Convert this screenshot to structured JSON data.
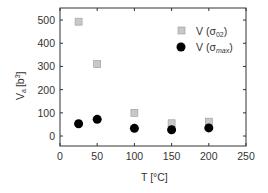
{
  "chart_data": {
    "type": "scatter",
    "title": "",
    "xlabel": "T [°C]",
    "ylabel": "Va [b3]",
    "xlim": [
      0,
      250
    ],
    "ylim": [
      -43,
      552
    ],
    "xticks": [
      0,
      50,
      100,
      150,
      200,
      250
    ],
    "yticks": [
      0,
      100,
      200,
      300,
      400,
      500
    ],
    "grid": false,
    "legend_position": "upper right",
    "series": [
      {
        "name": "V (σ02)",
        "marker": "square",
        "color": "#c8c8c8",
        "x": [
          25,
          50,
          100,
          150,
          200
        ],
        "y": [
          493,
          310,
          100,
          55,
          62
        ]
      },
      {
        "name": "V (σmax)",
        "marker": "circle",
        "color": "#000000",
        "x": [
          25,
          50,
          100,
          150,
          200
        ],
        "y": [
          53,
          72,
          33,
          27,
          35
        ]
      }
    ]
  },
  "labels": {
    "x_axis": "T [°C]",
    "y_axis_main": "V",
    "y_axis_sub": "a",
    "y_axis_unit_open": "[b",
    "y_axis_unit_sup": "3",
    "y_axis_unit_close": "]",
    "legend_1_main": "V (σ",
    "legend_1_sub": "02",
    "legend_1_close": ")",
    "legend_2_main": "V (σ",
    "legend_2_sub": "max",
    "legend_2_close": ")"
  }
}
